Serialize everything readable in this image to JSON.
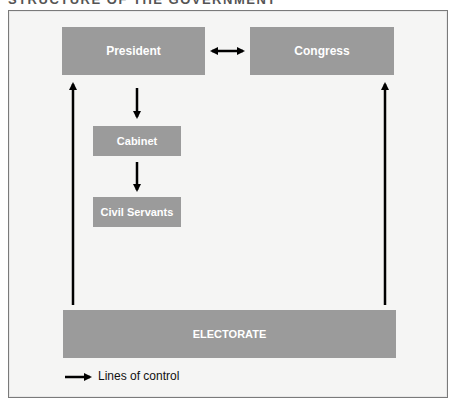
{
  "title": "STRUCTURE OF THE GOVERNMENT",
  "nodes": {
    "president": "President",
    "congress": "Congress",
    "cabinet": "Cabinet",
    "civil_servants": "Civil Servants",
    "electorate": "ELECTORATE"
  },
  "edges": [
    {
      "from": "President",
      "to": "Congress",
      "type": "bidirectional"
    },
    {
      "from": "President",
      "to": "Cabinet",
      "type": "directed"
    },
    {
      "from": "Cabinet",
      "to": "Civil Servants",
      "type": "directed"
    },
    {
      "from": "ELECTORATE",
      "to": "President",
      "type": "directed"
    },
    {
      "from": "ELECTORATE",
      "to": "Congress",
      "type": "directed"
    }
  ],
  "legend": {
    "label": "Lines of control",
    "icon": "arrow-right-icon"
  },
  "colors": {
    "box": "#9b9b9b",
    "box_text": "#ffffff",
    "background": "#f5f5f4",
    "arrow": "#000000"
  }
}
